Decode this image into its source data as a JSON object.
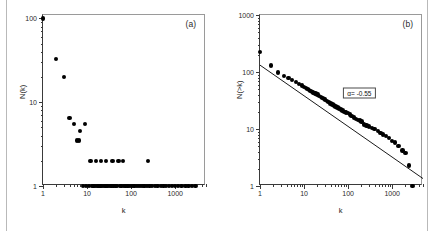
{
  "figure": {
    "panels": [
      {
        "tag": "(a)",
        "xlabel": "k",
        "ylabel": "N(k)",
        "xticks": [
          "1",
          "10",
          "100",
          "1000"
        ],
        "yticks": [
          "1",
          "10",
          "100"
        ]
      },
      {
        "tag": "(b)",
        "xlabel": "k",
        "ylabel": "N(>k)",
        "xticks": [
          "1",
          "10",
          "100",
          "1000"
        ],
        "yticks": [
          "1",
          "10",
          "100",
          "1000"
        ],
        "annotation": "α= -0.55"
      }
    ]
  },
  "chart_data": [
    {
      "type": "scatter",
      "title": "(a)",
      "xlabel": "k",
      "ylabel": "N(k)",
      "xscale": "log",
      "yscale": "log",
      "xlim": [
        1,
        5000
      ],
      "ylim": [
        1,
        110
      ],
      "xticks": [
        1,
        10,
        100,
        1000
      ],
      "yticks": [
        1,
        10,
        100
      ],
      "grid": false,
      "legend": null,
      "points": [
        [
          1,
          100
        ],
        [
          2,
          33
        ],
        [
          3,
          20
        ],
        [
          4,
          6.5
        ],
        [
          5,
          5.5
        ],
        [
          6,
          3.5
        ],
        [
          6.5,
          3.5
        ],
        [
          7,
          4.5
        ],
        [
          9,
          5.5
        ],
        [
          12,
          2
        ],
        [
          16,
          2
        ],
        [
          21,
          2
        ],
        [
          27,
          2
        ],
        [
          38,
          2
        ],
        [
          52,
          2
        ],
        [
          65,
          2
        ],
        [
          240,
          2
        ],
        [
          8,
          1
        ],
        [
          9.5,
          1
        ],
        [
          11,
          1
        ],
        [
          13,
          1
        ],
        [
          14,
          1
        ],
        [
          15,
          1
        ],
        [
          17,
          1
        ],
        [
          18,
          1
        ],
        [
          19,
          1
        ],
        [
          20,
          1
        ],
        [
          22,
          1
        ],
        [
          24,
          1
        ],
        [
          26,
          1
        ],
        [
          28,
          1
        ],
        [
          30,
          1
        ],
        [
          33,
          1
        ],
        [
          36,
          1
        ],
        [
          40,
          1
        ],
        [
          44,
          1
        ],
        [
          48,
          1
        ],
        [
          55,
          1
        ],
        [
          60,
          1
        ],
        [
          68,
          1
        ],
        [
          75,
          1
        ],
        [
          82,
          1
        ],
        [
          90,
          1
        ],
        [
          100,
          1
        ],
        [
          110,
          1
        ],
        [
          120,
          1
        ],
        [
          135,
          1
        ],
        [
          150,
          1
        ],
        [
          165,
          1
        ],
        [
          185,
          1
        ],
        [
          200,
          1
        ],
        [
          230,
          1
        ],
        [
          260,
          1
        ],
        [
          300,
          1
        ],
        [
          350,
          1
        ],
        [
          400,
          1
        ],
        [
          470,
          1
        ],
        [
          540,
          1
        ],
        [
          620,
          1
        ],
        [
          720,
          1
        ],
        [
          850,
          1
        ],
        [
          1000,
          1
        ],
        [
          1150,
          1
        ],
        [
          1400,
          1
        ],
        [
          1700,
          1
        ],
        [
          2000,
          1
        ],
        [
          2400,
          1
        ],
        [
          2900,
          1
        ]
      ]
    },
    {
      "type": "scatter",
      "title": "(b)",
      "xlabel": "k",
      "ylabel": "N(>k)",
      "xscale": "log",
      "yscale": "log",
      "xlim": [
        1,
        5000
      ],
      "ylim": [
        1,
        1000
      ],
      "xticks": [
        1,
        10,
        100,
        1000
      ],
      "yticks": [
        1,
        10,
        100,
        1000
      ],
      "grid": false,
      "annotations": [
        {
          "text": "α= -0.55",
          "x": 180,
          "y": 42,
          "boxed": true
        }
      ],
      "fit": {
        "kind": "power-law",
        "exponent": -0.55,
        "label": "α= -0.55",
        "x": [
          1,
          5000
        ],
        "y": [
          132,
          1.35
        ]
      },
      "points": [
        [
          1,
          225
        ],
        [
          1.8,
          130
        ],
        [
          2.6,
          98
        ],
        [
          3.5,
          85
        ],
        [
          4.4,
          78
        ],
        [
          5.4,
          72
        ],
        [
          6.5,
          66
        ],
        [
          7.6,
          62
        ],
        [
          9,
          58
        ],
        [
          10,
          55
        ],
        [
          11,
          52
        ],
        [
          12,
          50
        ],
        [
          13,
          48
        ],
        [
          14,
          46
        ],
        [
          15,
          45
        ],
        [
          16,
          44
        ],
        [
          17,
          43
        ],
        [
          18,
          42
        ],
        [
          19,
          41
        ],
        [
          20,
          40
        ],
        [
          22,
          38
        ],
        [
          24,
          36
        ],
        [
          26,
          35
        ],
        [
          28,
          34
        ],
        [
          30,
          33
        ],
        [
          33,
          31
        ],
        [
          36,
          30
        ],
        [
          40,
          28
        ],
        [
          44,
          27
        ],
        [
          48,
          26
        ],
        [
          52,
          25
        ],
        [
          57,
          24
        ],
        [
          62,
          23
        ],
        [
          68,
          22
        ],
        [
          75,
          21
        ],
        [
          82,
          20
        ],
        [
          90,
          19.5
        ],
        [
          100,
          19
        ],
        [
          110,
          18
        ],
        [
          120,
          17
        ],
        [
          135,
          16
        ],
        [
          150,
          15
        ],
        [
          165,
          14.5
        ],
        [
          185,
          14
        ],
        [
          200,
          13.5
        ],
        [
          230,
          12
        ],
        [
          260,
          11.5
        ],
        [
          300,
          11
        ],
        [
          350,
          10.5
        ],
        [
          400,
          10
        ],
        [
          470,
          9.2
        ],
        [
          540,
          8.5
        ],
        [
          620,
          8
        ],
        [
          720,
          7.5
        ],
        [
          850,
          7
        ],
        [
          1000,
          6.2
        ],
        [
          1150,
          5.8
        ],
        [
          1400,
          5
        ],
        [
          1700,
          4.2
        ],
        [
          2000,
          3.8
        ],
        [
          2400,
          2.3
        ],
        [
          2900,
          1
        ]
      ]
    }
  ]
}
